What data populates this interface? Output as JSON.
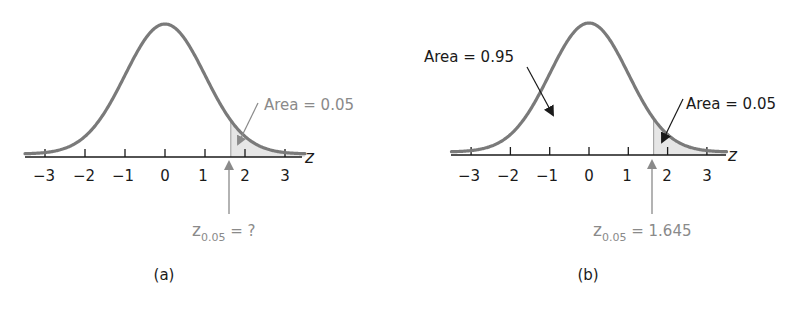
{
  "chart_data": [
    {
      "type": "area",
      "panel_label": "(a)",
      "distribution": "standard normal",
      "xlabel": "z",
      "x_ticks": [
        -3,
        -2,
        -1,
        0,
        1,
        2,
        3
      ],
      "x_tick_labels": [
        "−3",
        "−2",
        "−1",
        "0",
        "1",
        "2",
        "3"
      ],
      "xlim": [
        -3.5,
        3.5
      ],
      "shaded_region": {
        "from": 1.645,
        "to": 3.5,
        "area": 0.05
      },
      "annotations": [
        {
          "text": "Area = 0.05",
          "points_to": "right tail"
        },
        {
          "text_main": "z",
          "text_sub": "0.05",
          "text_rest": " = ?",
          "points_to": 1.645
        }
      ]
    },
    {
      "type": "area",
      "panel_label": "(b)",
      "distribution": "standard normal",
      "xlabel": "z",
      "x_ticks": [
        -3,
        -2,
        -1,
        0,
        1,
        2,
        3
      ],
      "x_tick_labels": [
        "−3",
        "−2",
        "−1",
        "0",
        "1",
        "2",
        "3"
      ],
      "xlim": [
        -3.5,
        3.5
      ],
      "shaded_region": {
        "from": 1.645,
        "to": 3.5,
        "area": 0.05
      },
      "annotations": [
        {
          "text": "Area = 0.95",
          "points_to": "central region"
        },
        {
          "text": "Area = 0.05",
          "points_to": "right tail"
        },
        {
          "text_main": "z",
          "text_sub": "0.05",
          "text_rest": " = 1.645",
          "points_to": 1.645
        }
      ]
    }
  ],
  "colors": {
    "curve": "#7a7a7a",
    "axis": "#1a1a1a",
    "shade": "#e6e6e6",
    "annotation_gray": "#8a8a8a",
    "annotation_black": "#1a1a1a"
  },
  "panels": {
    "a": {
      "label": "(a)",
      "axis_var": "z",
      "ticks": [
        "−3",
        "−2",
        "−1",
        "0",
        "1",
        "2",
        "3"
      ],
      "area_label": "Area = 0.05",
      "z_main": "z",
      "z_sub": "0.05",
      "z_rest": " = ?"
    },
    "b": {
      "label": "(b)",
      "axis_var": "z",
      "ticks": [
        "−3",
        "−2",
        "−1",
        "0",
        "1",
        "2",
        "3"
      ],
      "area_center_label": "Area = 0.95",
      "area_label": "Area = 0.05",
      "z_main": "z",
      "z_sub": "0.05",
      "z_rest": " = 1.645"
    }
  }
}
